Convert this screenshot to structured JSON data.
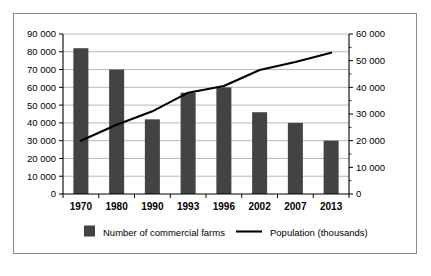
{
  "chart_data": {
    "type": "bar",
    "title": "",
    "subtitle": "",
    "xlabel": "",
    "ylabel": "",
    "categories": [
      "1970",
      "1980",
      "1990",
      "1993",
      "1996",
      "2002",
      "2007",
      "2013"
    ],
    "grid": true,
    "legend_position": "bottom",
    "series": [
      {
        "name": "Number of commercial farms",
        "type": "bar",
        "axis": "left",
        "color": "#434343",
        "values": [
          82000,
          70000,
          42000,
          57000,
          60000,
          46000,
          40000,
          30000
        ]
      },
      {
        "name": "Population (thousands)",
        "type": "line",
        "axis": "right",
        "color": "#000000",
        "values": [
          20000,
          26000,
          31000,
          38000,
          40500,
          46500,
          49500,
          53000
        ]
      }
    ],
    "left_axis": {
      "label": "",
      "ylim": [
        0,
        90000
      ],
      "tick_step": 10000,
      "tick_labels": [
        "0",
        "10 000",
        "20 000",
        "30 000",
        "40 000",
        "50 000",
        "60 000",
        "70 000",
        "80 000",
        "90 000"
      ]
    },
    "right_axis": {
      "label": "",
      "ylim": [
        0,
        60000
      ],
      "tick_step": 10000,
      "minor_tick_step": 5000,
      "tick_labels": [
        "0",
        "10 000",
        "20 000",
        "30 000",
        "40 000",
        "50 000",
        "60 000"
      ]
    }
  },
  "legend": {
    "items": [
      {
        "label": "Number of commercial farms",
        "marker": "square-swatch",
        "color": "#434343"
      },
      {
        "label": "Population (thousands)",
        "marker": "line-swatch",
        "color": "#000000"
      }
    ]
  }
}
